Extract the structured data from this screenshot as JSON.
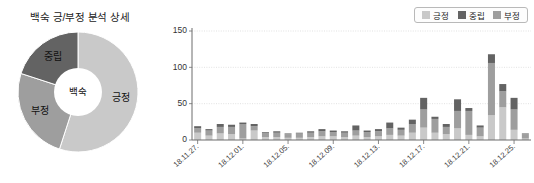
{
  "donut": {
    "title": "백숙 긍/부정 분석 상세",
    "center_label": "백숙",
    "segments": [
      {
        "label": "긍정",
        "value": 55,
        "color": "#c9c9c9"
      },
      {
        "label": "부정",
        "value": 25,
        "color": "#9e9e9e"
      },
      {
        "label": "중립",
        "value": 20,
        "color": "#636363"
      }
    ]
  },
  "legend": {
    "items": [
      {
        "label": "긍정",
        "color": "#c9c9c9"
      },
      {
        "label": "중립",
        "color": "#636363"
      },
      {
        "label": "부정",
        "color": "#9e9e9e"
      }
    ]
  },
  "chart_data": {
    "type": "bar",
    "title": "",
    "xlabel": "",
    "ylabel": "",
    "stacked": true,
    "grid": true,
    "legend_position": "top-right",
    "ylim": [
      0,
      150
    ],
    "yticks": [
      0,
      50,
      100,
      150
    ],
    "ytick_labels": [
      "0",
      "50",
      "100",
      "150"
    ],
    "categories": [
      "18.11.27",
      "18.11.28",
      "18.11.29",
      "18.11.30",
      "18.12.01",
      "18.12.02",
      "18.12.03",
      "18.12.04",
      "18.12.05",
      "18.12.06",
      "18.12.07",
      "18.12.08",
      "18.12.09",
      "18.12.10",
      "18.12.11",
      "18.12.12",
      "18.12.13",
      "18.12.14",
      "18.12.15",
      "18.12.16",
      "18.12.17",
      "18.12.18",
      "18.12.19",
      "18.12.20",
      "18.12.21",
      "18.12.22",
      "18.12.23",
      "18.12.24",
      "18.12.25",
      "18.12.26"
    ],
    "xtick_labels": [
      "18.11.27.",
      "18.12.01.",
      "18.12.05.",
      "18.12.09.",
      "18.12.13.",
      "18.12.17.",
      "18.12.21.",
      "18.12.25."
    ],
    "xtick_indices": [
      0,
      4,
      8,
      12,
      16,
      20,
      24,
      28
    ],
    "series": [
      {
        "name": "긍정",
        "color": "#c9c9c9",
        "values": [
          10,
          6,
          9,
          8,
          2,
          13,
          4,
          4,
          3,
          3,
          4,
          5,
          5,
          4,
          6,
          4,
          5,
          7,
          6,
          10,
          17,
          10,
          8,
          16,
          7,
          5,
          34,
          45,
          14,
          2
        ]
      },
      {
        "name": "부정",
        "color": "#9e9e9e",
        "values": [
          6,
          7,
          9,
          10,
          20,
          6,
          6,
          6,
          5,
          6,
          6,
          7,
          6,
          6,
          7,
          7,
          7,
          9,
          8,
          12,
          25,
          19,
          10,
          24,
          33,
          12,
          72,
          22,
          28,
          6
        ]
      },
      {
        "name": "중립",
        "color": "#636363",
        "values": [
          3,
          2,
          4,
          3,
          2,
          3,
          1,
          2,
          1,
          1,
          2,
          3,
          2,
          2,
          7,
          2,
          3,
          8,
          3,
          6,
          16,
          3,
          4,
          16,
          4,
          3,
          12,
          10,
          16,
          1
        ]
      }
    ]
  }
}
